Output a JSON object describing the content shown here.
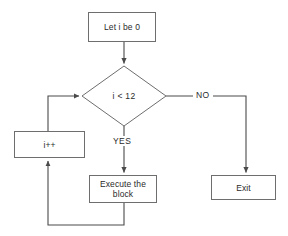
{
  "diagram": {
    "type": "flowchart",
    "background_color": "#ffffff",
    "line_color": "#6e6e6e",
    "text_color": "#2b2b2b",
    "nodes": {
      "init": {
        "label": "Let i be 0",
        "shape": "rectangle"
      },
      "condition": {
        "label": "i < 12",
        "shape": "diamond"
      },
      "increment": {
        "label": "i++",
        "shape": "rectangle"
      },
      "body": {
        "label": "Execute the block",
        "line1": "Execute the",
        "line2": "block",
        "shape": "rectangle"
      },
      "exit": {
        "label": "Exit",
        "shape": "rectangle"
      }
    },
    "edge_labels": {
      "no": "NO",
      "yes": "YES"
    }
  }
}
